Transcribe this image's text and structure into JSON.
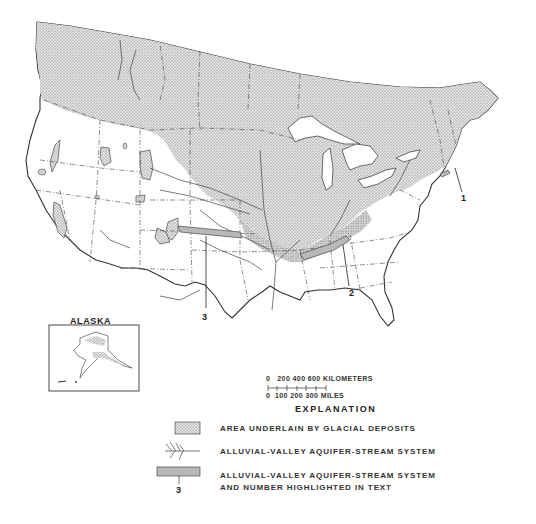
{
  "figure": {
    "inset_title": "ALASKA",
    "callouts": [
      {
        "number": "1",
        "location": "Northeast coast (New England)"
      },
      {
        "number": "2",
        "location": "Ohio River valley"
      },
      {
        "number": "3",
        "location": "Platte River valley"
      }
    ],
    "scale_bar": {
      "kilometers_label": "0   200 400 600 KILOMETERS",
      "miles_label": "0  100 200 300 MILES",
      "km_ticks": [
        "0",
        "200",
        "400",
        "600"
      ],
      "mile_ticks": [
        "0",
        "100",
        "200",
        "300"
      ],
      "km_unit": "KILOMETERS",
      "mile_unit": "MILES"
    },
    "legend": {
      "title": "EXPLANATION",
      "items": [
        {
          "symbol": "stippled-area",
          "label": "AREA UNDERLAIN BY GLACIAL DEPOSITS"
        },
        {
          "symbol": "stream-network",
          "label": "ALLUVIAL-VALLEY AQUIFER-STREAM SYSTEM"
        },
        {
          "symbol": "gray-bar-with-number",
          "label_line1": "ALLUVIAL-VALLEY AQUIFER-STREAM SYSTEM",
          "label_line2": "AND NUMBER HIGHLIGHTED IN TEXT",
          "example_number": "3"
        }
      ]
    },
    "colors": {
      "glacial_fill": "#c9c9c9",
      "highlight_bar": "#b8b8b8",
      "line": "#333333",
      "background": "#ffffff"
    }
  }
}
